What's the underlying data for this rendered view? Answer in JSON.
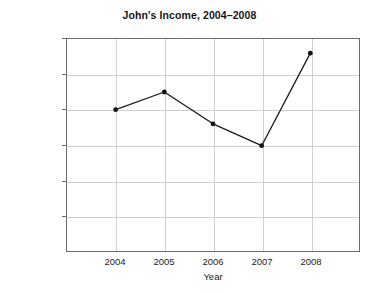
{
  "chart_data": {
    "type": "line",
    "title": "John's Income, 2004–2008",
    "xlabel": "Year",
    "ylabel": "",
    "x": [
      "2004",
      "2005",
      "2006",
      "2007",
      "2008"
    ],
    "categories": [
      "2004",
      "2005",
      "2006",
      "2007",
      "2008"
    ],
    "values": [
      20000,
      22500,
      18000,
      14900,
      28000
    ],
    "series": [
      {
        "name": "John's Income",
        "values": [
          20000,
          22500,
          18000,
          14900,
          28000
        ]
      }
    ],
    "ylim": [
      0,
      30000
    ],
    "ytick_values": [
      5000,
      10000,
      15000,
      20000,
      25000,
      30000
    ],
    "ytick_labels": [
      "$ 5,000",
      "$ 10,000",
      "$ 15,000",
      "$ 20,000",
      "$ 25,000",
      "$ 30,000"
    ],
    "xtick_labels": [
      "2004",
      "2005",
      "2006",
      "2007",
      "2008"
    ],
    "grid": true,
    "legend": false,
    "legend_position": "none",
    "marker": "circle",
    "colors": {
      "line": "#1a1a1a",
      "marker": "#111111",
      "grid": "#cfcfcf",
      "frame": "#6b6b6b",
      "background": "#ffffff",
      "text": "#1d1d1d"
    }
  }
}
